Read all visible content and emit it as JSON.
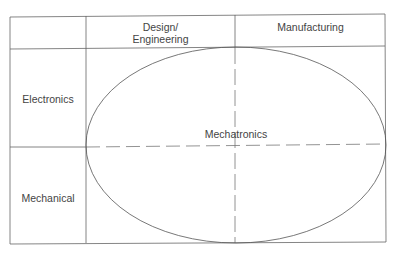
{
  "diagram": {
    "type": "matrix-venn",
    "columns": [
      {
        "id": "design",
        "label_line1": "Design/",
        "label_line2": "Engineering"
      },
      {
        "id": "manufacturing",
        "label": "Manufacturing"
      }
    ],
    "rows": [
      {
        "id": "electronics",
        "label": "Electronics"
      },
      {
        "id": "mechanical",
        "label": "Mechanical"
      }
    ],
    "center": {
      "label": "Mechatronics",
      "shape": "ellipse",
      "spans": "all four quadrants"
    },
    "colors": {
      "line": "#555555",
      "dashed_line": "#777777",
      "text": "#444444",
      "background": "#ffffff"
    }
  }
}
